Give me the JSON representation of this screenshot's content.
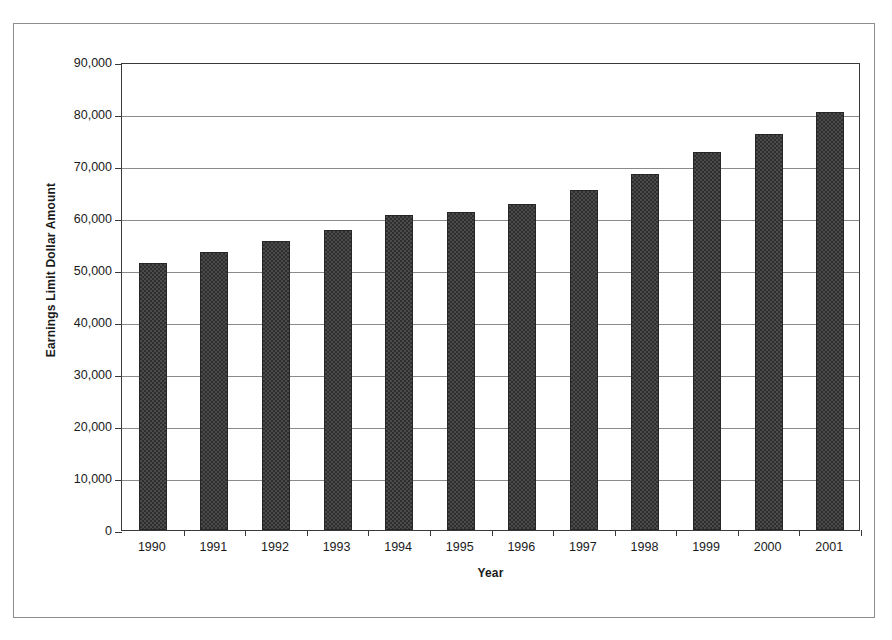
{
  "chart_data": {
    "type": "bar",
    "title": "",
    "xlabel": "Year",
    "ylabel": "Earnings Limit Dollar Amount",
    "categories": [
      "1990",
      "1991",
      "1992",
      "1993",
      "1994",
      "1995",
      "1996",
      "1997",
      "1998",
      "1999",
      "2000",
      "2001"
    ],
    "values": [
      51300,
      53400,
      55500,
      57600,
      60600,
      61200,
      62700,
      65400,
      68400,
      72600,
      76200,
      80400
    ],
    "series": [
      {
        "name": "Earnings Limit Dollar Amount",
        "values": [
          51300,
          53400,
          55500,
          57600,
          60600,
          61200,
          62700,
          65400,
          68400,
          72600,
          76200,
          80400
        ]
      }
    ],
    "ylim": [
      0,
      90000
    ],
    "ytick_values": [
      0,
      10000,
      20000,
      30000,
      40000,
      50000,
      60000,
      70000,
      80000,
      90000
    ],
    "ytick_labels": [
      "0",
      "10,000",
      "20,000",
      "30,000",
      "40,000",
      "50,000",
      "60,000",
      "70,000",
      "80,000",
      "90,000"
    ],
    "grid": true,
    "grid_axis": "y",
    "legend": false,
    "legend_position": "none",
    "bar_color": "#4b4b4b",
    "bar_pattern": "checkered-dither"
  },
  "figure": {
    "frame": true,
    "background_color": "#ffffff",
    "axis_color": "#3a3a3a",
    "gridline_color": "#8a8a8a"
  }
}
